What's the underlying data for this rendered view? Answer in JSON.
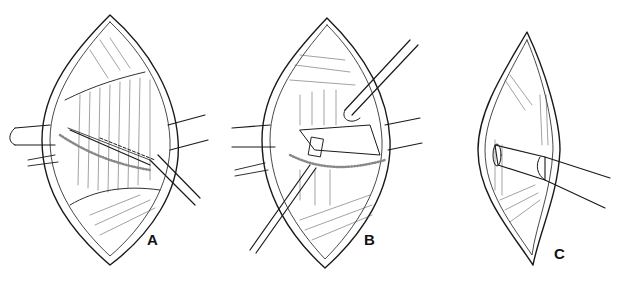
{
  "figure": {
    "panels": [
      {
        "id": "A",
        "label": "A",
        "description": "Oval surgical incision retracted open with two retractors; scalpel making an oblique incision along dashed line through muscle layer"
      },
      {
        "id": "B",
        "label": "B",
        "description": "Incision retracted with blunt instrument separating tissue layers; dissector inserted from lower left"
      },
      {
        "id": "C",
        "label": "C",
        "description": "Narrow elliptical incision with a cylindrical tube/cannula inserted through tissue layers from the right"
      }
    ],
    "colors": {
      "ink": "#1a1a1a",
      "background": "#ffffff"
    }
  }
}
